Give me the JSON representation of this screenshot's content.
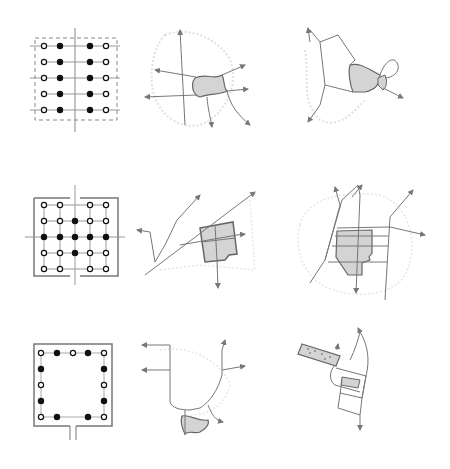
{
  "figure": {
    "layout": "3x3 grid of schematic diagrams",
    "colors": {
      "background": "#ffffff",
      "line": "#7a7a7a",
      "dark_line": "#555555",
      "faint_boundary": "#dcdcdc",
      "fill_area": "#d4d4d4",
      "node_filled": "#111111",
      "node_open": "#ffffff"
    },
    "rows": [
      {
        "row": 1,
        "panels": [
          {
            "id": "r1-grid",
            "type": "grid-plan",
            "description": "5x4 node grid, dashed boundary, vertical axis; outer columns open nodes, inner columns filled nodes"
          },
          {
            "id": "r1-map-a",
            "type": "city-map",
            "description": "small shaded core with radiating arrowed roads"
          },
          {
            "id": "r1-map-b",
            "type": "city-map",
            "description": "shaded core with loop road and arrows"
          }
        ]
      },
      {
        "row": 2,
        "panels": [
          {
            "id": "r2-grid",
            "type": "grid-plan",
            "description": "5x5 node grid in walled square with four gates; cross of filled nodes"
          },
          {
            "id": "r2-map-a",
            "type": "city-map",
            "description": "square subdivided core with diagonal roads"
          },
          {
            "id": "r2-map-b",
            "type": "city-map",
            "description": "large shaded core with parallel roads and arrows"
          }
        ]
      },
      {
        "row": 3,
        "panels": [
          {
            "id": "r3-grid",
            "type": "grid-plan",
            "description": "perimeter ring of alternating open/filled nodes with single gate at bottom"
          },
          {
            "id": "r3-map-a",
            "type": "city-map",
            "description": "small shaded core below a road loop with arrows"
          },
          {
            "id": "r3-map-b",
            "type": "city-map",
            "description": "elongated shaded strip with adjacent road loop"
          }
        ]
      }
    ]
  }
}
